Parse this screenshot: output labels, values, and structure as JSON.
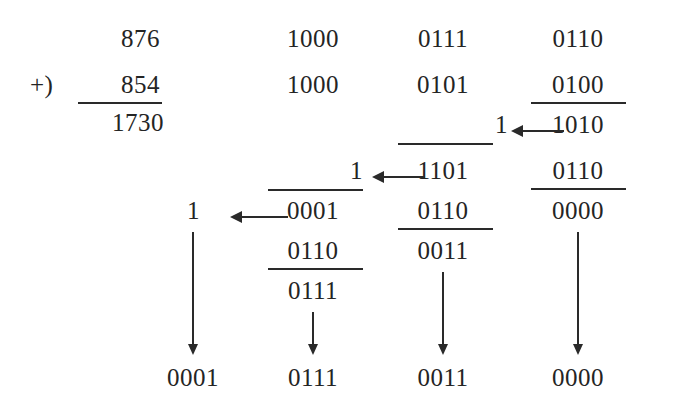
{
  "figure": {
    "type": "binary-bcd-addition-worksheet",
    "ink_color": "#242424",
    "background_color": "#ffffff"
  },
  "decimal_addition": {
    "augend": "876",
    "plus_sign": "+)",
    "addend": "854",
    "sum": "1730"
  },
  "groups": [
    {
      "id": "thousands",
      "result": "0001"
    },
    {
      "id": "hundreds",
      "operand_a": "1000",
      "operand_b": "1000",
      "carry_in": "1",
      "partial_sum": "0001",
      "correction": "0110",
      "result": "0111"
    },
    {
      "id": "tens",
      "operand_a": "0111",
      "operand_b": "0101",
      "carry_in": "1",
      "partial_sum": "1101",
      "correction": "0110",
      "result": "0011"
    },
    {
      "id": "units",
      "operand_a": "0110",
      "operand_b": "0100",
      "partial_sum": "1010",
      "correction": "0110",
      "result": "0000"
    }
  ],
  "carries": [
    {
      "from": "units",
      "to": "tens",
      "value": "1"
    },
    {
      "from": "tens",
      "to": "hundreds",
      "value": "1"
    },
    {
      "from": "hundreds",
      "to": "thousands",
      "value": "1"
    }
  ],
  "final_results": {
    "thousands": "0001",
    "hundreds": "0111",
    "tens": "0011",
    "units": "0000"
  }
}
